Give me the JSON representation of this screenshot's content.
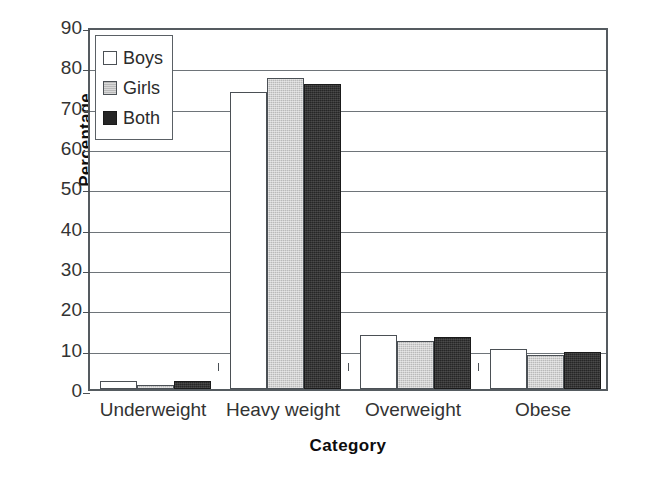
{
  "chart_data": {
    "type": "bar",
    "title": "",
    "xlabel": "Category",
    "ylabel": "Percentage",
    "categories": [
      "Underweight",
      "Heavy weight",
      "Overweight",
      "Obese"
    ],
    "series": [
      {
        "name": "Boys",
        "color": "#ffffff",
        "values": [
          2,
          73.7,
          13.5,
          10
        ]
      },
      {
        "name": "Girls",
        "color": "#b9b9b9",
        "values": [
          1,
          77.2,
          12,
          8.5
        ]
      },
      {
        "name": "Both",
        "color": "#262626",
        "values": [
          2,
          75.7,
          13,
          9.2
        ]
      }
    ],
    "ylim": [
      0,
      90
    ],
    "ytick_labels": [
      "90",
      "80",
      "70",
      "60",
      "50",
      "40",
      "30",
      "20",
      "10",
      "0"
    ],
    "ytick_values": [
      90,
      80,
      70,
      60,
      50,
      40,
      30,
      20,
      10,
      0
    ],
    "ytick_step": 10,
    "grid": true,
    "grid_axis": "y",
    "legend_position": "upper-left-inside",
    "legend_entries": [
      "Boys",
      "Girls",
      "Both"
    ]
  }
}
